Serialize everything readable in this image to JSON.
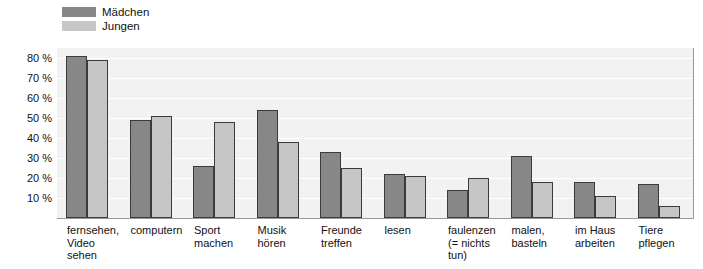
{
  "legend": {
    "items": [
      {
        "label": "Mädchen",
        "color": "#878787",
        "key": "maedchen"
      },
      {
        "label": "Jungen",
        "color": "#c6c6c6",
        "key": "jungen"
      }
    ]
  },
  "axis": {
    "y_ticks": [
      "80 %",
      "70 %",
      "60 %",
      "50 %",
      "40 %",
      "30 %",
      "20 %",
      "10 %"
    ],
    "y_tick_values": [
      80,
      70,
      60,
      50,
      40,
      30,
      20,
      10
    ]
  },
  "chart_data": {
    "type": "bar",
    "title": "",
    "subtitle": "",
    "xlabel": "",
    "ylabel": "",
    "ylim": [
      0,
      85
    ],
    "grid": true,
    "legend_position": "top-left",
    "bar_order": [
      "Jungen",
      "Mädchen"
    ],
    "categories": [
      "fernsehen,\nVideo\nsehen",
      "computern",
      "Sport\nmachen",
      "Musik\nhören",
      "Freunde\ntreffen",
      "lesen",
      "faulenzen\n(= nichts\ntun)",
      "malen,\nbasteln",
      "im Haus\narbeiten",
      "Tiere\npflegen"
    ],
    "series": [
      {
        "name": "Jungen",
        "color": "#c6c6c6",
        "values": [
          79,
          51,
          48,
          38,
          25,
          21,
          20,
          18,
          11,
          6
        ]
      },
      {
        "name": "Mädchen",
        "color": "#878787",
        "values": [
          81,
          49,
          26,
          54,
          33,
          22,
          14,
          31,
          18,
          17
        ]
      }
    ]
  }
}
